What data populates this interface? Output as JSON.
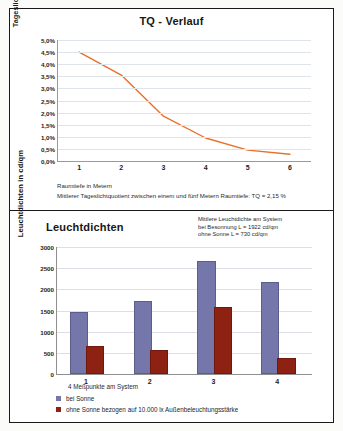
{
  "chart_data": [
    {
      "type": "line",
      "title": "TQ - Verlauf",
      "xlabel": "Raumtiefe in Metern",
      "ylabel": "Tageslichtquotient in %",
      "x": [
        1,
        2,
        3,
        4,
        5,
        6
      ],
      "xticks": [
        "1",
        "2",
        "3",
        "4",
        "5",
        "6"
      ],
      "yticks": [
        "0,0%",
        "0,5%",
        "1,0%",
        "1,5%",
        "2,0%",
        "2,5%",
        "3,0%",
        "3,5%",
        "4,0%",
        "4,5%",
        "5,0%"
      ],
      "ylim": [
        0,
        5
      ],
      "values": [
        4.5,
        3.55,
        1.85,
        0.95,
        0.45,
        0.28
      ],
      "series_color": "#e8702a",
      "grid": true,
      "legend": "none",
      "caption_line1": "Raumtiefe in Metern",
      "caption_line2": "Mittlerer Tageslichtquotient zwischen einem und fünf Metern Raumtiefe: TQ = 2,15 %"
    },
    {
      "type": "bar",
      "title": "Leuchtdichten",
      "xlabel": "4 Meßpunkte am System",
      "ylabel": "Leuchtdichten in cd/qm",
      "categories": [
        "1",
        "2",
        "3",
        "4"
      ],
      "yticks": [
        "0",
        "500",
        "1000",
        "1500",
        "2000",
        "2500",
        "3000"
      ],
      "ylim": [
        0,
        3000
      ],
      "grid": true,
      "legend": "bottom",
      "series": [
        {
          "name": "bei Sonne",
          "color": "#7577ab",
          "values": [
            1420,
            1680,
            2620,
            2120
          ]
        },
        {
          "name": "ohne Sonne bezogen auf 10.000 lx Außenbeleuchtungsstärke",
          "color": "#8e2212",
          "values": [
            610,
            510,
            1530,
            330
          ]
        }
      ],
      "annotation_line1": "Mittlere Leuchtdichte am System",
      "annotation_line2": "bei Besonnung L = 1922 cd/qm",
      "annotation_line3": "ohne Sonne L = 730 cd/qm"
    }
  ]
}
